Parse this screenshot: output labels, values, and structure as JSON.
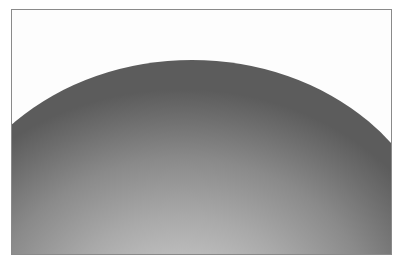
{
  "image": {
    "subject": "grayscale curved dome surface",
    "colors": {
      "background": "#ffffff",
      "frame_border": "#8a8a8a",
      "dome_edge": "#5c5c5c",
      "dome_highlight": "#d2d2d2"
    }
  }
}
